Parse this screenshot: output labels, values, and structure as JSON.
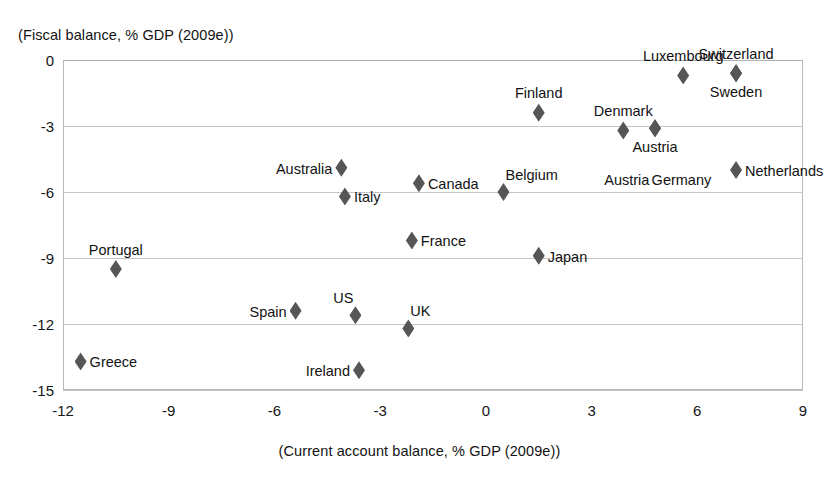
{
  "chart_data": {
    "type": "scatter",
    "title": "",
    "xlabel": "(Current account balance, % GDP (2009e))",
    "ylabel": "(Fiscal balance, % GDP (2009e))",
    "xlim": [
      -12,
      9
    ],
    "ylim": [
      -15,
      0
    ],
    "xticks": [
      "-12",
      "-9",
      "-6",
      "-3",
      "0",
      "3",
      "6",
      "9"
    ],
    "xtick_values": [
      -12,
      -9,
      -6,
      -3,
      0,
      3,
      6,
      9
    ],
    "yticks": [
      "0",
      "-3",
      "-6",
      "-9",
      "-12",
      "-15"
    ],
    "ytick_values": [
      0,
      -3,
      -6,
      -9,
      -12,
      -15
    ],
    "grid": "horizontal",
    "legend": "none",
    "marker": "diamond",
    "marker_color": "#565656",
    "points": [
      {
        "label": "Greece",
        "x": -11.5,
        "y": -13.7,
        "label_pos": "right"
      },
      {
        "label": "Portugal",
        "x": -10.5,
        "y": -9.5,
        "label_pos": "top"
      },
      {
        "label": "Spain",
        "x": -5.4,
        "y": -11.4,
        "label_pos": "left"
      },
      {
        "label": "US",
        "x": -3.7,
        "y": -11.6,
        "label_pos": "tl"
      },
      {
        "label": "Ireland",
        "x": -3.6,
        "y": -14.1,
        "label_pos": "left"
      },
      {
        "label": "UK",
        "x": -2.2,
        "y": -12.2,
        "label_pos": "tr"
      },
      {
        "label": "Australia",
        "x": -4.1,
        "y": -4.9,
        "label_pos": "left"
      },
      {
        "label": "Italy",
        "x": -4.0,
        "y": -6.2,
        "label_pos": "right"
      },
      {
        "label": "France",
        "x": -2.1,
        "y": -8.2,
        "label_pos": "right"
      },
      {
        "label": "Canada",
        "x": -1.9,
        "y": -5.6,
        "label_pos": "right"
      },
      {
        "label": "Belgium",
        "x": 0.5,
        "y": -6.0,
        "label_pos": "tr"
      },
      {
        "label": "Japan",
        "x": 1.5,
        "y": -8.9,
        "label_pos": "right"
      },
      {
        "label": "Finland",
        "x": 1.5,
        "y": -2.4,
        "label_pos": "top"
      },
      {
        "label": "Denmark",
        "x": 3.9,
        "y": -3.2,
        "label_pos": "top"
      },
      {
        "label": "Austria",
        "x": 4.8,
        "y": -3.1,
        "label_pos": "bottom"
      },
      {
        "label": "Germany",
        "x": 4.8,
        "y": -3.1,
        "label_pos": "hidden"
      },
      {
        "label": "Luxembourg",
        "x": 5.6,
        "y": -0.7,
        "label_pos": "top"
      },
      {
        "label": "Switzerland",
        "x": 7.1,
        "y": -0.6,
        "label_pos": "top"
      },
      {
        "label": "Sweden",
        "x": 7.1,
        "y": -0.6,
        "label_pos": "bottom"
      },
      {
        "label": "Netherlands",
        "x": 7.1,
        "y": -5.0,
        "label_pos": "right"
      }
    ],
    "standalone_labels": [
      {
        "text": "Austria",
        "x": 4.0,
        "y": -5.45
      },
      {
        "text": "Germany",
        "x": 5.55,
        "y": -5.45
      }
    ]
  }
}
